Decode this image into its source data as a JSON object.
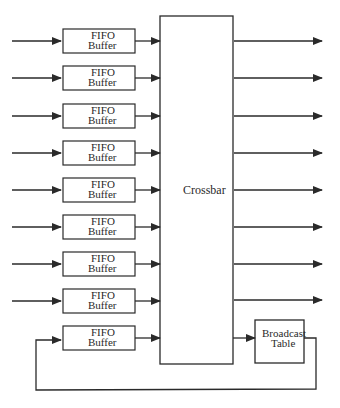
{
  "diagram": {
    "crossbar_label": "Crossbar",
    "broadcast_label_line1": "Broadcast",
    "broadcast_label_line2": "Table",
    "buffer_label_line1": "FIFO",
    "buffer_label_line2": "Buffer",
    "buffer_count": 9,
    "output_count": 8,
    "colors": {
      "line": "#2a2a2a",
      "background": "#ffffff"
    }
  }
}
